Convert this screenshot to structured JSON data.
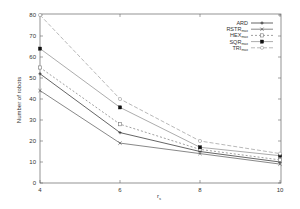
{
  "chart_data": {
    "type": "line",
    "title": "",
    "xlabel": "r_s",
    "ylabel": "Number of robots",
    "x": [
      4,
      6,
      8,
      10
    ],
    "xlim": [
      4,
      10
    ],
    "ylim": [
      0,
      80
    ],
    "xticks": [
      "4",
      "6",
      "8",
      "10"
    ],
    "yticks": [
      "0",
      "10",
      "20",
      "30",
      "40",
      "50",
      "60",
      "70",
      "80"
    ],
    "grid": false,
    "legend_position": "upper right",
    "series": [
      {
        "name": "ARD",
        "sub": "",
        "values": [
          52,
          24,
          15,
          10
        ],
        "marker": "plus",
        "dash": "",
        "color": "#222222"
      },
      {
        "name": "RSTR",
        "sub": "max",
        "values": [
          44,
          19,
          14,
          9
        ],
        "marker": "cross",
        "dash": "",
        "color": "#555555"
      },
      {
        "name": "HEX",
        "sub": "max",
        "values": [
          55,
          28,
          16,
          11
        ],
        "marker": "open-square",
        "dash": "2,2",
        "color": "#777777"
      },
      {
        "name": "SQR",
        "sub": "max",
        "values": [
          64,
          36,
          17,
          13
        ],
        "marker": "filled-square",
        "dash": "",
        "color": "#888888"
      },
      {
        "name": "TRI",
        "sub": "max",
        "values": [
          80,
          40,
          20,
          14
        ],
        "marker": "open-circle",
        "dash": "4,2",
        "color": "#999999"
      }
    ]
  }
}
